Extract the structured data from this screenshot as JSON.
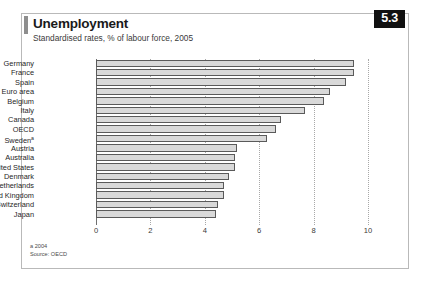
{
  "panel": {
    "title": "Unemployment",
    "subtitle": "Standardised rates, % of labour force, 2005",
    "badge": "5.3",
    "footnote_a": "a 2004",
    "footnote_source": "Source: OECD",
    "accent_color": "#8e8e8e",
    "badge_bg": "#111111",
    "bar_fill": "#d9d9d9",
    "bar_stroke": "#5a5a5a",
    "grid_color": "#a8a8a8"
  },
  "chart_data": {
    "type": "bar",
    "orientation": "horizontal",
    "title": "Unemployment",
    "subtitle": "Standardised rates, % of labour force, 2005",
    "xlabel": "",
    "ylabel": "",
    "xlim": [
      0,
      10
    ],
    "xticks": [
      0,
      2,
      4,
      6,
      8,
      10
    ],
    "xtick_labels": [
      "0",
      "2",
      "4",
      "6",
      "8",
      "10"
    ],
    "grid": true,
    "legend": false,
    "categories": [
      "Germany",
      "France",
      "Spain",
      "Euro area",
      "Belgium",
      "Italy",
      "Canada",
      "OECD",
      "Sweden",
      "Austria",
      "Australia",
      "United States",
      "Denmark",
      "Netherlands",
      "United Kingdom",
      "Switzerland",
      "Japan"
    ],
    "category_notes": {
      "Sweden": "a"
    },
    "values": [
      9.5,
      9.5,
      9.2,
      8.6,
      8.4,
      7.7,
      6.8,
      6.6,
      6.3,
      5.2,
      5.1,
      5.1,
      4.9,
      4.7,
      4.7,
      4.5,
      4.4
    ],
    "units": "% of labour force",
    "source": "OECD"
  }
}
